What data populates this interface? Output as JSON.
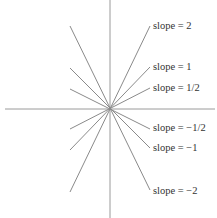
{
  "diagram": {
    "title": "",
    "center": {
      "x": 110,
      "y": 109
    },
    "axes": {
      "horizontal": {
        "x1": 5,
        "y1": 109,
        "x2": 215,
        "y2": 109
      },
      "vertical": {
        "x1": 110,
        "y1": 0,
        "x2": 110,
        "y2": 218
      }
    },
    "lines": [
      {
        "slope": "2",
        "label": "slope = 2",
        "x1": 70,
        "y1": 192,
        "x2": 150,
        "y2": 26,
        "label_x": 153,
        "label_y": 20
      },
      {
        "slope": "1",
        "label": "slope = 1",
        "x1": 70,
        "y1": 150,
        "x2": 150,
        "y2": 67,
        "label_x": 153,
        "label_y": 61
      },
      {
        "slope": "1/2",
        "label": "slope = 1/2",
        "x1": 70,
        "y1": 129,
        "x2": 150,
        "y2": 88,
        "label_x": 153,
        "label_y": 82
      },
      {
        "slope": "-1/2",
        "label": "slope = −1/2",
        "x1": 70,
        "y1": 89,
        "x2": 150,
        "y2": 129,
        "label_x": 153,
        "label_y": 122
      },
      {
        "slope": "-1",
        "label": "slope = −1",
        "x1": 70,
        "y1": 68,
        "x2": 150,
        "y2": 148,
        "label_x": 153,
        "label_y": 142
      },
      {
        "slope": "-2",
        "label": "slope = −2",
        "x1": 70,
        "y1": 26,
        "x2": 150,
        "y2": 190,
        "label_x": 153,
        "label_y": 185
      }
    ],
    "colors": {
      "axis": "#9a9a9a",
      "line": "#8a8a8a",
      "text": "#333333",
      "background": "#ffffff"
    }
  }
}
